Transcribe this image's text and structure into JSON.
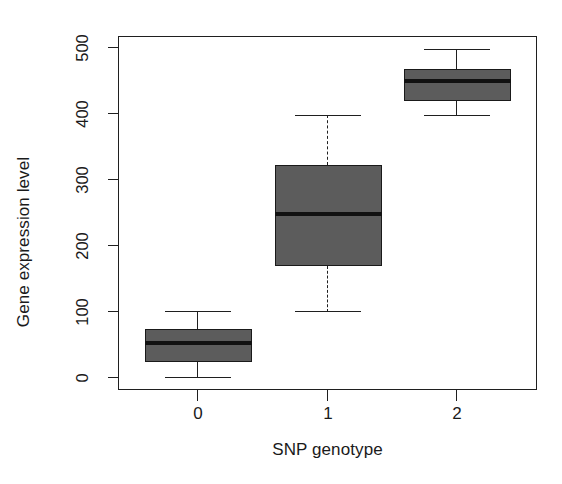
{
  "chart_data": {
    "type": "box",
    "title": "",
    "subtitle": "",
    "xlabel": "SNP genotype",
    "ylabel": "Gene expression level",
    "categories": [
      "0",
      "1",
      "2"
    ],
    "xticklabels": [
      "0",
      "1",
      "2"
    ],
    "yticklabels": [
      "0",
      "100",
      "200",
      "300",
      "400",
      "500"
    ],
    "yticks": [
      0,
      100,
      200,
      300,
      400,
      500
    ],
    "ylim": [
      -18,
      536
    ],
    "xlim": [
      0,
      3
    ],
    "grid": false,
    "legend": false,
    "legend_position": "none",
    "box_fill_color": "#5c5c5c",
    "line_color": "#1f1f1f",
    "median_color": "#111111",
    "background_color": "#ffffff",
    "boxes": [
      {
        "category": "0",
        "whisker_low": 0,
        "q1": 25,
        "median": 53,
        "q3": 75,
        "whisker_high": 100,
        "whisker_style": "solid",
        "outliers": []
      },
      {
        "category": "1",
        "whisker_low": 100,
        "q1": 170,
        "median": 248,
        "q3": 322,
        "whisker_high": 398,
        "whisker_style": "dashed",
        "outliers": []
      },
      {
        "category": "2",
        "whisker_low": 398,
        "q1": 420,
        "median": 450,
        "q3": 468,
        "whisker_high": 498,
        "whisker_style": "solid",
        "outliers": []
      }
    ]
  },
  "axes": {
    "y_title": "Gene expression level",
    "x_title": "SNP genotype"
  }
}
